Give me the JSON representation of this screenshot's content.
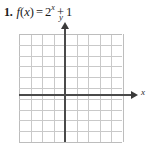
{
  "problem": {
    "number": "1.",
    "function_name": "f",
    "variable": "x",
    "equals": "=",
    "base": "2",
    "exponent": "x",
    "plus": "+",
    "constant": "1",
    "open_paren": "(",
    "close_paren": ")",
    "full_text": "1. f(x) = 2^x + 1"
  },
  "graph": {
    "x_axis_label": "x",
    "y_axis_label": "y",
    "columns": 9,
    "rows": 10,
    "cell_size_px": 11.5,
    "origin_col_index": 4,
    "origin_row_index": 5,
    "grid_color": "#c9c9c9",
    "axis_color": "#4a4a4a",
    "text_color": "#1a1a1a",
    "background": "#ffffff",
    "plotted_curve": "none"
  },
  "chart_data": {
    "type": "line",
    "title": "",
    "xlabel": "x",
    "ylabel": "y",
    "xlim": [
      -4,
      5
    ],
    "ylim": [
      -5,
      5
    ],
    "grid": true,
    "legend": "none",
    "series": [
      {
        "name": "f(x) = 2^x + 1",
        "x": [],
        "values": [],
        "drawn": false
      }
    ],
    "note": "Blank coordinate grid provided for the student to graph f(x) = 2^x + 1; no curve is drawn."
  }
}
